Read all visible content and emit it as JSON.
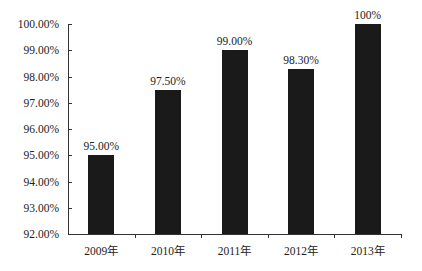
{
  "chart_data": {
    "type": "bar",
    "title": "",
    "xlabel": "",
    "ylabel": "",
    "categories": [
      "2009年",
      "2010年",
      "2011年",
      "2012年",
      "2013年"
    ],
    "values": [
      95.0,
      97.5,
      99.0,
      98.3,
      100.0
    ],
    "data_labels": [
      "95.00%",
      "97.50%",
      "99.00%",
      "98.30%",
      "100%"
    ],
    "ylim": [
      92,
      100
    ],
    "yticks": [
      "92.00%",
      "93.00%",
      "94.00%",
      "95.00%",
      "96.00%",
      "97.00%",
      "98.00%",
      "99.00%",
      "100.00%"
    ],
    "grid": false,
    "legend": null,
    "bar_color": "#1a1a1a"
  }
}
